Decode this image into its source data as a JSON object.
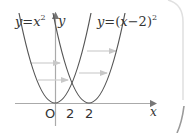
{
  "diagram": {
    "type": "function-graph-translation",
    "colors": {
      "curve": "#555555",
      "axis": "#aaaaaa",
      "arrow": "#c8c8c8",
      "text": "#333333",
      "border": "#d0d0d0"
    },
    "curves": [
      {
        "name": "parabola-1",
        "label": {
          "y": "y",
          "eq": "=",
          "x": "x",
          "exp": "2"
        },
        "equation": "y=x^2",
        "vertex": [
          0,
          0
        ]
      },
      {
        "name": "parabola-2",
        "label": {
          "y": "y",
          "eq": "=",
          "open": "(",
          "x": "x",
          "minus": "−",
          "two": "2",
          "close": ")",
          "exp": "2"
        },
        "equation": "y=(x-2)^2",
        "vertex": [
          2,
          0
        ]
      }
    ],
    "axes": {
      "x_label": "x",
      "y_label": "y"
    },
    "ticks": {
      "origin": "O",
      "x1": "2",
      "x2": "2"
    },
    "translation_arrows": 4,
    "shift": "+2 along x"
  }
}
